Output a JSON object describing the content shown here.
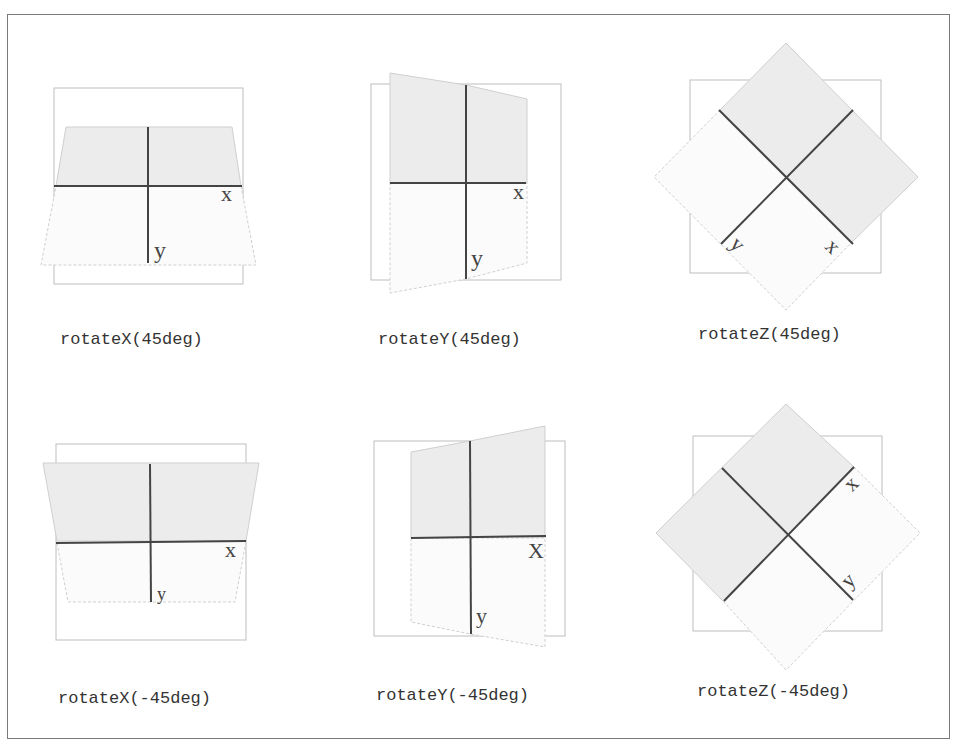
{
  "figure": {
    "panels": [
      {
        "id": "rotateX-45",
        "caption": "rotateX(45deg)",
        "x_label": "x",
        "y_label": "y"
      },
      {
        "id": "rotateY-45",
        "caption": "rotateY(45deg)",
        "x_label": "x",
        "y_label": "y"
      },
      {
        "id": "rotateZ-45",
        "caption": "rotateZ(45deg)",
        "x_label": "x",
        "y_label": "y"
      },
      {
        "id": "rotateX-neg45",
        "caption": "rotateX(-45deg)",
        "x_label": "x",
        "y_label": "y"
      },
      {
        "id": "rotateY-neg45",
        "caption": "rotateY(-45deg)",
        "x_label": "X",
        "y_label": "y"
      },
      {
        "id": "rotateZ-neg45",
        "caption": "rotateZ(-45deg)",
        "x_label": "x",
        "y_label": "y"
      }
    ]
  },
  "colors": {
    "frame": "#7a7a7a",
    "reference_box": "#b8b8b8",
    "shaded_fill": "#ececec",
    "plane_edge": "#c8c8c8",
    "axis": "#444444"
  }
}
